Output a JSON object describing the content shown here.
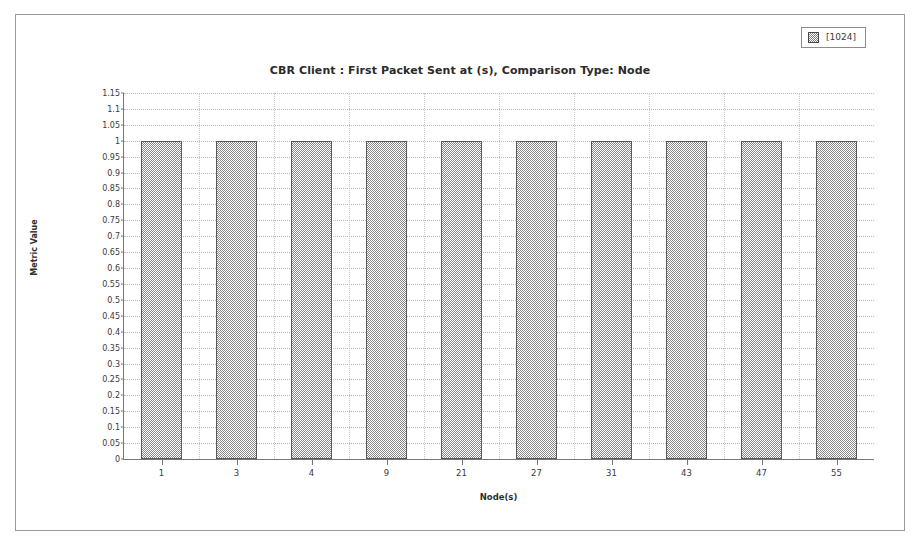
{
  "chart_data": {
    "type": "bar",
    "title": "CBR Client : First Packet Sent at (s), Comparison Type: Node",
    "xlabel": "Node(s)",
    "ylabel": "Metric Value",
    "categories": [
      "1",
      "3",
      "4",
      "9",
      "21",
      "27",
      "31",
      "43",
      "47",
      "55"
    ],
    "values": [
      1,
      1,
      1,
      1,
      1,
      1,
      1,
      1,
      1,
      1
    ],
    "series": [
      {
        "name": "[1024]",
        "values": [
          1,
          1,
          1,
          1,
          1,
          1,
          1,
          1,
          1,
          1
        ]
      }
    ],
    "ylim": [
      0,
      1.15
    ],
    "ytick_step": 0.05,
    "yticks": [
      "0",
      "0.05",
      "0.1",
      "0.15",
      "0.2",
      "0.25",
      "0.3",
      "0.35",
      "0.4",
      "0.45",
      "0.5",
      "0.55",
      "0.6",
      "0.65",
      "0.7",
      "0.75",
      "0.8",
      "0.85",
      "0.9",
      "0.95",
      "1",
      "1.05",
      "1.1",
      "1.15"
    ],
    "grid": true,
    "legend_position": "top-right",
    "bar_fill": "checkered-gray",
    "colors": {
      "bar_fill": "#8a8a8a",
      "bar_border": "#5a5a5a",
      "axis": "#777777",
      "gridline": "#b9b9b9",
      "frame": "#9a9a9a",
      "text": "#2b2b2b",
      "background": "#ffffff"
    }
  },
  "legend": {
    "entries": [
      {
        "label": "[1024]",
        "swatch": "checkered-gray-swatch"
      }
    ]
  }
}
